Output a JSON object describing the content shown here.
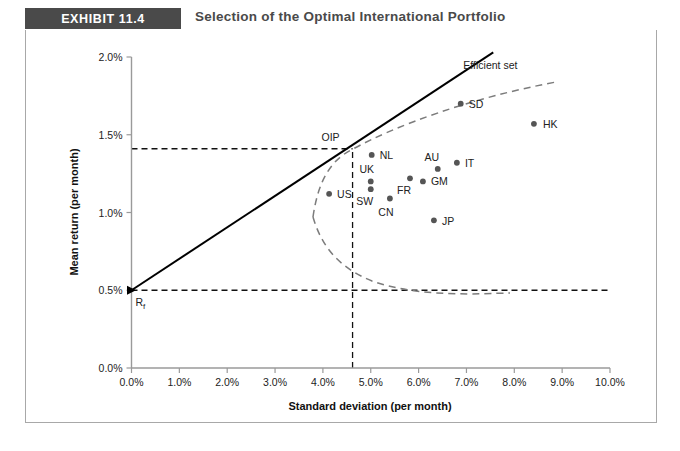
{
  "header": {
    "badge": "EXHIBIT 11.4",
    "title": "Selection of the Optimal International Portfolio"
  },
  "chart_data": {
    "type": "scatter",
    "title": "Selection of the Optimal International Portfolio",
    "xlabel": "Standard deviation (per month)",
    "ylabel": "Mean return (per month)",
    "xlim": [
      0,
      10
    ],
    "ylim": [
      0,
      2
    ],
    "xticks": [
      "0.0%",
      "1.0%",
      "2.0%",
      "3.0%",
      "4.0%",
      "5.0%",
      "6.0%",
      "7.0%",
      "8.0%",
      "9.0%",
      "10.0%"
    ],
    "yticks": [
      "0.0%",
      "0.5%",
      "1.0%",
      "1.5%",
      "2.0%"
    ],
    "grid": false,
    "legend": false,
    "points": [
      {
        "label": "US",
        "x": 4.13,
        "y": 1.12,
        "label_dx": 8,
        "label_dy": 4
      },
      {
        "label": "NL",
        "x": 5.02,
        "y": 1.37,
        "label_dx": 8,
        "label_dy": 4
      },
      {
        "label": "UK",
        "x": 5.0,
        "y": 1.2,
        "label_dx": -4,
        "label_dy": -8
      },
      {
        "label": "SW",
        "x": 5.0,
        "y": 1.15,
        "label_dx": -6,
        "label_dy": 16
      },
      {
        "label": "CN",
        "x": 5.4,
        "y": 1.09,
        "label_dx": -4,
        "label_dy": 17
      },
      {
        "label": "FR",
        "x": 5.82,
        "y": 1.22,
        "label_dx": -6,
        "label_dy": 16
      },
      {
        "label": "GM",
        "x": 6.09,
        "y": 1.2,
        "label_dx": 8,
        "label_dy": 4
      },
      {
        "label": "AU",
        "x": 6.4,
        "y": 1.28,
        "label_dx": -6,
        "label_dy": -8
      },
      {
        "label": "IT",
        "x": 6.8,
        "y": 1.32,
        "label_dx": 8,
        "label_dy": 4
      },
      {
        "label": "SD",
        "x": 6.88,
        "y": 1.7,
        "label_dx": 8,
        "label_dy": 4
      },
      {
        "label": "HK",
        "x": 8.41,
        "y": 1.57,
        "label_dx": 9,
        "label_dy": 4
      },
      {
        "label": "JP",
        "x": 6.32,
        "y": 0.95,
        "label_dx": 8,
        "label_dy": 5
      }
    ],
    "special_points": [
      {
        "label": "OIP",
        "x": 4.62,
        "y": 1.41,
        "label_dx": -22,
        "label_dy": -8
      },
      {
        "label": "Rf",
        "x": 0.0,
        "y": 0.5,
        "label_dx": 4,
        "label_dy": 16
      }
    ],
    "annotations": [
      {
        "label": "Efficient set",
        "x": 7.5,
        "y": 1.92
      }
    ],
    "series_lines": [
      {
        "name": "capital-market-line",
        "style": "solid",
        "from": {
          "x": 0.0,
          "y": 0.5
        },
        "to": {
          "x": 7.56,
          "y": 2.03
        }
      },
      {
        "name": "efficient-frontier",
        "style": "dashed"
      }
    ],
    "guides": [
      {
        "name": "oip-horizontal-guide",
        "from": {
          "x": 0.0,
          "y": 1.41
        },
        "to": {
          "x": 4.62,
          "y": 1.41
        }
      },
      {
        "name": "oip-vertical-guide",
        "from": {
          "x": 4.62,
          "y": 0.0
        },
        "to": {
          "x": 4.62,
          "y": 1.41
        }
      },
      {
        "name": "rf-horizontal-guide",
        "from": {
          "x": 0.0,
          "y": 0.5
        },
        "to": {
          "x": 10.0,
          "y": 0.5
        }
      }
    ]
  }
}
